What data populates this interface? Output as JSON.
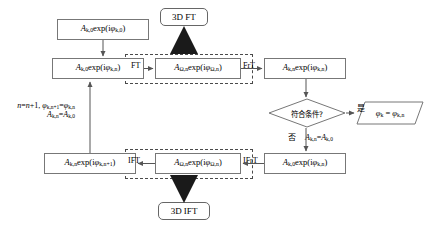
{
  "diagram": {
    "title_terminals": {
      "top": "3D FT",
      "bottom": "3D IFT"
    },
    "nodes": {
      "input": "A_{k,0} exp(iφ_{k,0})",
      "object_plane": "A_{k,0} exp(iφ_{k,n})",
      "ft_out": "A_{Ω,n} exp(iφ_{Ω,n})",
      "frt_out": "A_{k,n} exp(iφ_{k,n})",
      "frt_back_in": "A_{k,0} exp(iφ_{k,n})",
      "ift_in": "A_{Ω,n} exp(iφ_{Ω,n})",
      "ift_out": "A_{k,n} exp(iφ_{k,n+1})",
      "result": "φ_k = φ_{k,n}"
    },
    "decision": "符合条件?",
    "branch_labels": {
      "yes": "是",
      "no": "否"
    },
    "edge_labels": {
      "ft": "FT",
      "frt": "FrT",
      "ifrt": "IFrT",
      "ift": "IFT",
      "no_assign": "A_{k,n}=A_{k,0}"
    },
    "feedback_note_line1": "n=n+1, φ_{k,n+1}=φ_{k,n}",
    "feedback_note_line2": "A_{k,n}=A_{k,0}",
    "colors": {
      "box_border": "#777777",
      "dashed_border": "#4a4a4a",
      "arrow": "#555555",
      "thick_arrow": "#1a1a1a",
      "text": "#000000",
      "background": "#ffffff"
    }
  }
}
